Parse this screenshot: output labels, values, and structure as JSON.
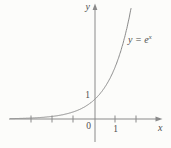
{
  "figure": {
    "background": "#fcfcfa",
    "stroke_color": "#8a8a8a",
    "text_color": "#4d4d4d"
  },
  "chart_data": {
    "type": "line",
    "title": "",
    "function": "y = e^x",
    "xlabel": "x",
    "ylabel": "y",
    "x_range": [
      -4,
      1.765
    ],
    "y_range": [
      0,
      5.9
    ],
    "x_ticks": [
      -3,
      -2,
      -1,
      1,
      2
    ],
    "y_ticks": [
      1
    ],
    "grid": false,
    "legend": "none",
    "origin_label": "0",
    "x_tick_label_1": "1",
    "y_tick_label_1": "1",
    "annotation": {
      "lhs": "y",
      "eq": " = ",
      "base": "e",
      "sup": "x"
    },
    "series": [
      {
        "name": "y = e^x",
        "x": [
          -4,
          -3,
          -2,
          -1,
          0,
          1,
          1.765
        ],
        "y": [
          0.018,
          0.05,
          0.135,
          0.368,
          1,
          2.718,
          5.84
        ]
      }
    ],
    "pixel_mapping": {
      "origin_x": 94,
      "origin_y": 119,
      "x_unit": 21,
      "y_unit": 19
    }
  }
}
